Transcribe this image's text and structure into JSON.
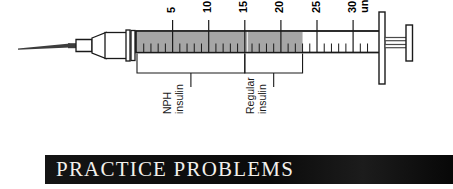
{
  "figure": {
    "name": "insulin-syringe-diagram",
    "device": "insulin syringe",
    "scale": {
      "unit_label": "units",
      "major_ticks": [
        5,
        10,
        15,
        20,
        25,
        30
      ],
      "minor_tick_step": 1,
      "range_min": 0,
      "range_max": 32
    },
    "fill": {
      "total_units": 23,
      "color": "#a6a6a6"
    },
    "brackets": [
      {
        "label_line1": "NPH",
        "label_line2": "insulin",
        "from_units": 0,
        "to_units": 15
      },
      {
        "label_line1": "Regular",
        "label_line2": "insulin",
        "from_units": 15,
        "to_units": 23
      }
    ],
    "colors": {
      "outline": "#1a1a1a",
      "fill_gray": "#a6a6a6",
      "needle": "#3d3d3d",
      "background": "#ffffff"
    }
  },
  "banner": {
    "title": "PRACTICE PROBLEMS",
    "icon": "calculator-icon",
    "bar_color": "#0b0b0b",
    "text_color": "#f2f0ec"
  }
}
